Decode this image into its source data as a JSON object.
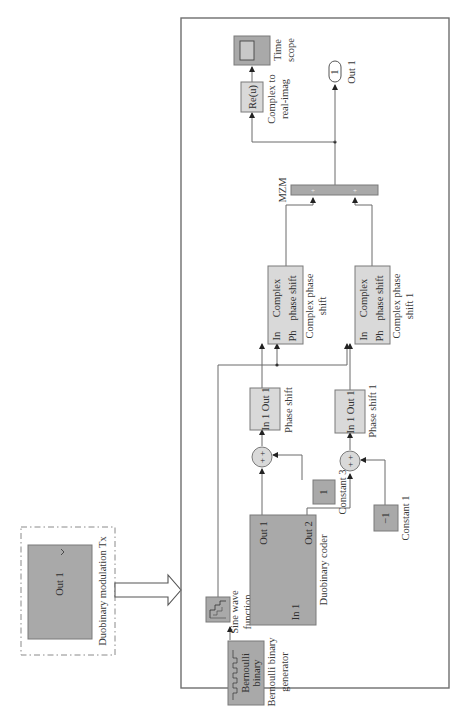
{
  "figure": {
    "subsystem": {
      "title": "Duobinary modulation Tx",
      "port_label": "Out 1"
    },
    "blocks": {
      "sine_wave": {
        "label_line1": "Sine wave",
        "label_line2": "function"
      },
      "bernoulli": {
        "inner_line1": "Bernoulli",
        "inner_line2": "binary",
        "label_line1": "Bernoulli binary",
        "label_line2": "generator"
      },
      "duobinary_coder": {
        "in_port": "In 1",
        "out1_port": "Out 1",
        "out2_port": "Out 2",
        "label": "Duobinary coder"
      },
      "constant_3": {
        "value": "1",
        "label": "Constant 3"
      },
      "constant_1": {
        "value": "−1",
        "label": "Constant 1"
      },
      "sum_top": {
        "signs": "+ +"
      },
      "sum_bottom": {
        "signs": "+ +"
      },
      "phase_shift": {
        "ports": "In 1 Out 1",
        "label": "Phase shift"
      },
      "phase_shift_1": {
        "ports": "In 1 Out 1",
        "label": "Phase shift 1"
      },
      "complex_phase_shift": {
        "in_port": "In",
        "ph_port": "Ph",
        "inner_line1": "Complex",
        "inner_line2": "phase shift",
        "label_line1": "Complex phase",
        "label_line2": "shift"
      },
      "complex_phase_shift_1": {
        "in_port": "In",
        "ph_port": "Ph",
        "inner_line1": "Complex",
        "inner_line2": "phase shift",
        "label_line1": "Complex phase",
        "label_line2": "shift 1"
      },
      "mzm": {
        "label": "MZM",
        "port_signs": [
          "+",
          "+"
        ]
      },
      "complex_to_real": {
        "inner": "Re(u)",
        "label_line1": "Complex to",
        "label_line2": "real-imag"
      },
      "time_scope": {
        "label_line1": "Time",
        "label_line2": "scope"
      },
      "out_1": {
        "value": "1",
        "label": "Out 1"
      }
    },
    "colors": {
      "dark_block": "#a9a9a9",
      "light_block": "#d9d9d9",
      "wire": "#6a6a6a"
    }
  }
}
